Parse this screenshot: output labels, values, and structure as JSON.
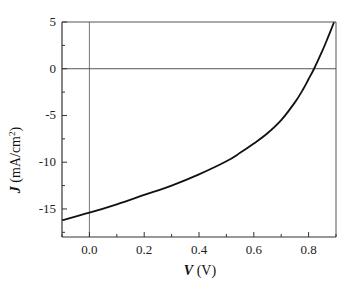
{
  "chart_data": {
    "type": "line",
    "title": "",
    "xlabel": "V (V)",
    "xlabel_var": "V",
    "xlabel_unit": "(V)",
    "ylabel": "J (mA/cm2)",
    "ylabel_var": "J",
    "ylabel_unit": "(mA/cm",
    "ylabel_sup": "2",
    "ylabel_close": ")",
    "xlim": [
      -0.1,
      0.9
    ],
    "ylim": [
      -18,
      5
    ],
    "xticks": [
      "0.0",
      "0.2",
      "0.4",
      "0.6",
      "0.8"
    ],
    "yticks": [
      "5",
      "0",
      "-5",
      "-10",
      "-15"
    ],
    "grid": false,
    "reference_lines": {
      "x": 0,
      "y": 0
    },
    "series": [
      {
        "name": "J-V curve",
        "x": [
          -0.1,
          0.0,
          0.1,
          0.2,
          0.3,
          0.4,
          0.5,
          0.55,
          0.6,
          0.65,
          0.7,
          0.75,
          0.78,
          0.8,
          0.82,
          0.85,
          0.87,
          0.893
        ],
        "y": [
          -16.2,
          -15.4,
          -14.5,
          -13.5,
          -12.5,
          -11.3,
          -9.9,
          -9.0,
          -8.0,
          -6.9,
          -5.5,
          -3.6,
          -2.2,
          -1.1,
          0.0,
          1.9,
          3.3,
          5.0
        ]
      }
    ]
  }
}
